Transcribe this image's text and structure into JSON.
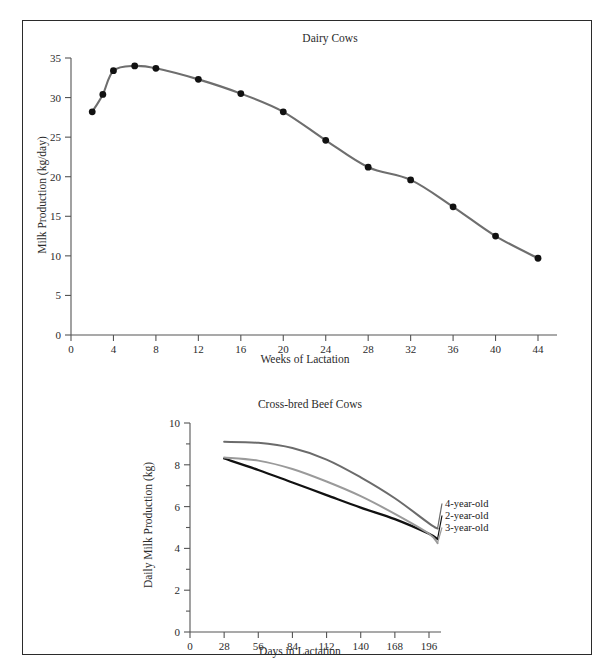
{
  "page": {
    "background": "#ffffff",
    "border_color": "#2b2b2b"
  },
  "chart_data": [
    {
      "type": "line",
      "id": "dairy-cows",
      "title": "Dairy Cows",
      "xlabel": "Weeks of Lactation",
      "ylabel": "Milk Production (kg/day)",
      "xlim": [
        0,
        46
      ],
      "ylim": [
        0,
        35
      ],
      "xticks": [
        0,
        4,
        8,
        12,
        16,
        20,
        24,
        28,
        32,
        36,
        40,
        44
      ],
      "yticks": [
        0,
        5,
        10,
        15,
        20,
        25,
        30,
        35
      ],
      "grid": false,
      "legend": "none",
      "marker": "filled-circle",
      "line_color": "#6e6e6e",
      "marker_color": "#111111",
      "x": [
        2,
        3,
        4,
        6,
        8,
        12,
        16,
        20,
        24,
        28,
        32,
        36,
        40,
        44
      ],
      "values": [
        28.2,
        30.4,
        33.4,
        34.0,
        33.7,
        32.3,
        30.5,
        28.2,
        24.6,
        21.2,
        19.6,
        16.2,
        12.5,
        9.7
      ]
    },
    {
      "type": "line",
      "id": "cross-bred-beef-cows",
      "title": "Cross-bred Beef Cows",
      "xlabel": "Days in Lactation",
      "ylabel": "Daily Milk Production (kg)",
      "xlim": [
        0,
        210
      ],
      "ylim": [
        0,
        10
      ],
      "xticks": [
        0,
        28,
        56,
        84,
        112,
        140,
        168,
        196
      ],
      "yticks": [
        0,
        2,
        4,
        6,
        8,
        10
      ],
      "grid": false,
      "legend": "right-inline",
      "x": [
        28,
        56,
        84,
        112,
        140,
        168,
        196,
        203
      ],
      "series": [
        {
          "name": "4-year-old",
          "color": "#6b6b6b",
          "values": [
            9.1,
            9.05,
            8.8,
            8.25,
            7.4,
            6.4,
            5.2,
            4.95
          ]
        },
        {
          "name": "2-year-old",
          "color": "#111111",
          "values": [
            8.3,
            7.75,
            7.15,
            6.55,
            5.95,
            5.4,
            4.7,
            4.45
          ]
        },
        {
          "name": "3-year-old",
          "color": "#9a9a9a",
          "values": [
            8.35,
            8.2,
            7.8,
            7.2,
            6.5,
            5.65,
            4.7,
            4.25
          ]
        }
      ]
    }
  ]
}
